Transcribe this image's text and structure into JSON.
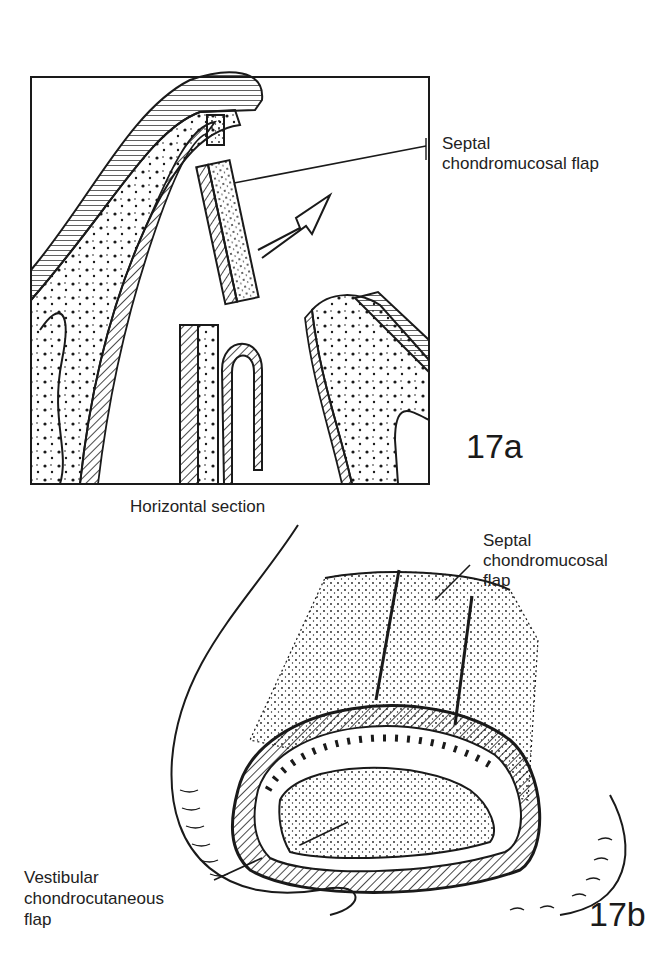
{
  "figure_17a": {
    "label": "17a",
    "caption": "Horizontal section",
    "callout_line1": "Septal",
    "callout_line2": "chondromucosal flap"
  },
  "figure_17b": {
    "label": "17b",
    "callout_top_line1": "Septal",
    "callout_top_line2": "chondromucosal",
    "callout_top_line3": "flap",
    "callout_bottom_line1": "Vestibular",
    "callout_bottom_line2": "chondrocutaneous",
    "callout_bottom_line3": "flap"
  },
  "colors": {
    "ink": "#1a1a1a",
    "paper": "#ffffff"
  }
}
